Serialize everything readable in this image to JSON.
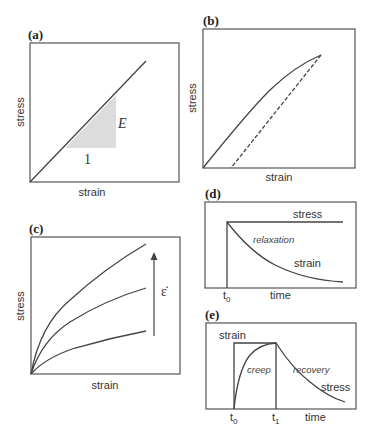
{
  "figure": {
    "panels": {
      "a": {
        "label": "(a)",
        "xlabel": "strain",
        "ylabel": "stress",
        "slope_label": "E",
        "run_label": "1"
      },
      "b": {
        "label": "(b)",
        "xlabel": "strain",
        "ylabel": "stress"
      },
      "c": {
        "label": "(c)",
        "xlabel": "strain",
        "ylabel": "stress",
        "arrow_label": "ε̇"
      },
      "d": {
        "label": "(d)",
        "xlabel": "time",
        "stress_label": "stress",
        "strain_label": "strain",
        "process_label": "relaxation",
        "t0_label": "t",
        "t0_sub": "0"
      },
      "e": {
        "label": "(e)",
        "xlabel": "time",
        "strain_label": "strain",
        "stress_label": "stress",
        "creep_label": "creep",
        "recovery_label": "recovery",
        "t0_label": "t",
        "t0_sub": "0",
        "t1_label": "t",
        "t1_sub": "1"
      }
    },
    "colors": {
      "line": "#444444",
      "frame": "#555555",
      "shade": "#dcdcdc"
    }
  }
}
